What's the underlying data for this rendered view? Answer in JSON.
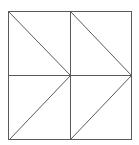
{
  "diagram": {
    "type": "geometric-figure",
    "width": 139,
    "height": 145,
    "stroke_color": "#5a5a5a",
    "background": "#ffffff",
    "square": {
      "x1": 8,
      "y1": 11,
      "x2": 131,
      "y2": 139
    },
    "midlines": {
      "vertical_x": 70,
      "horizontal_y": 75
    },
    "diagonals": [
      {
        "x1": 8,
        "y1": 11,
        "x2": 70,
        "y2": 75
      },
      {
        "x1": 70,
        "y1": 75,
        "x2": 9,
        "y2": 139
      },
      {
        "x1": 70,
        "y1": 11,
        "x2": 131,
        "y2": 75
      },
      {
        "x1": 131,
        "y1": 75,
        "x2": 70,
        "y2": 139
      }
    ]
  }
}
